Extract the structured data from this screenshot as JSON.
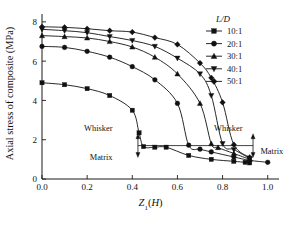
{
  "chart_data": {
    "type": "line",
    "title": "",
    "xlabel": "Z₁(H)",
    "ylabel": "Axial stress of composite (MPa)",
    "xlim": [
      0.0,
      1.05
    ],
    "ylim": [
      0,
      8.4
    ],
    "xticks": [
      "0.0",
      "0.2",
      "0.4",
      "0.6",
      "0.8",
      "1.0"
    ],
    "xtick_values": [
      0.0,
      0.2,
      0.4,
      0.6,
      0.8,
      1.0
    ],
    "yticks": [
      "0",
      "2",
      "4",
      "6",
      "8"
    ],
    "ytick_values": [
      0,
      2,
      4,
      6,
      8
    ],
    "grid": false,
    "legend_position": "top-right",
    "legend_title": "L/D",
    "series": [
      {
        "name": "10:1",
        "marker": "square",
        "x": [
          0.0,
          0.1,
          0.2,
          0.3,
          0.4,
          0.43,
          0.45,
          0.5,
          0.55,
          0.65,
          0.75,
          0.85,
          0.9,
          0.92
        ],
        "values": [
          4.9,
          4.8,
          4.6,
          4.25,
          3.5,
          2.35,
          1.65,
          1.62,
          1.62,
          1.2,
          1.0,
          0.9,
          0.85,
          0.82
        ]
      },
      {
        "name": "20:1",
        "marker": "circle",
        "x": [
          0.0,
          0.1,
          0.2,
          0.3,
          0.4,
          0.5,
          0.6,
          0.65,
          0.7,
          0.75,
          0.85,
          0.92,
          1.0
        ],
        "values": [
          6.75,
          6.7,
          6.5,
          6.2,
          5.72,
          5.05,
          3.85,
          1.72,
          1.52,
          1.38,
          1.12,
          0.95,
          0.85
        ]
      },
      {
        "name": "30:1",
        "marker": "triangle-up",
        "x": [
          0.0,
          0.1,
          0.2,
          0.3,
          0.4,
          0.5,
          0.6,
          0.7,
          0.75,
          0.78,
          0.85,
          0.92
        ],
        "values": [
          7.3,
          7.25,
          7.18,
          7.0,
          6.72,
          6.2,
          5.35,
          3.85,
          1.8,
          1.6,
          1.3,
          1.0
        ]
      },
      {
        "name": "40:1",
        "marker": "triangle-down",
        "x": [
          0.0,
          0.1,
          0.2,
          0.3,
          0.4,
          0.5,
          0.6,
          0.7,
          0.75,
          0.8,
          0.85,
          0.92
        ],
        "values": [
          7.62,
          7.55,
          7.45,
          7.25,
          7.05,
          6.75,
          6.15,
          5.35,
          4.25,
          1.8,
          1.5,
          1.05
        ]
      },
      {
        "name": "50:1",
        "marker": "diamond",
        "x": [
          0.0,
          0.1,
          0.2,
          0.3,
          0.4,
          0.5,
          0.6,
          0.7,
          0.75,
          0.8,
          0.85,
          0.92
        ],
        "values": [
          7.75,
          7.72,
          7.65,
          7.55,
          7.48,
          7.2,
          6.85,
          5.9,
          5.15,
          3.9,
          1.75,
          1.1
        ]
      }
    ],
    "annotations": [
      {
        "id": "whisker-left",
        "text": "Whisker",
        "x": 0.33,
        "y": 2.45
      },
      {
        "id": "matrix-left",
        "text": "Matrix",
        "x": 0.33,
        "y": 0.95
      },
      {
        "id": "whisker-right",
        "text": "Whisker",
        "x": 0.86,
        "y": 2.45
      },
      {
        "id": "matrix-right",
        "text": "Matrix",
        "x": 0.95,
        "y": 1.25
      },
      {
        "id": "plateau-line-level",
        "text": "",
        "x": 0.0,
        "y": 1.7
      }
    ]
  }
}
